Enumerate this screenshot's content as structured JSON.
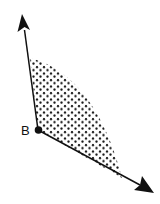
{
  "diagram": {
    "type": "angle-region",
    "vertex": {
      "label": "B",
      "x": 38,
      "y": 130
    },
    "rays": [
      {
        "name": "ray-up",
        "from": [
          38,
          130
        ],
        "to": [
          22,
          15
        ]
      },
      {
        "name": "ray-down-right",
        "from": [
          38,
          130
        ],
        "to": [
          153,
          192
        ]
      }
    ],
    "region": {
      "fill": "dotted",
      "description": "shaded interior of angle at B"
    },
    "colors": {
      "stroke": "#111111",
      "background": "#ffffff"
    }
  }
}
